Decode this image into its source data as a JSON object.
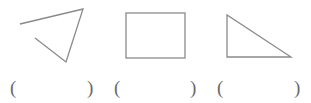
{
  "figures": [
    {
      "id": "open-triangle",
      "kind": "polyline",
      "points": "20,24 83,9 66,62 35,38"
    },
    {
      "id": "rectangle",
      "kind": "rect",
      "x": 126,
      "y": 13,
      "width": 59,
      "height": 45
    },
    {
      "id": "right-triangle",
      "kind": "polygon",
      "points": "227,15 227,57 291,57"
    }
  ],
  "stroke_color": "#8a8a8a",
  "answers": [
    {
      "open": "(",
      "close": ")",
      "blank": ""
    },
    {
      "open": "(",
      "close": ")",
      "blank": ""
    },
    {
      "open": "(",
      "close": ")",
      "blank": ""
    }
  ]
}
